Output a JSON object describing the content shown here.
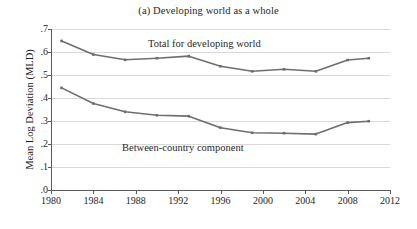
{
  "chart_data": {
    "type": "line",
    "title": "(a) Developing world as a whole",
    "xlabel": "",
    "ylabel": "Mean Log Deviation (MLD)",
    "xlim": [
      1980,
      2012
    ],
    "ylim": [
      0.0,
      0.7
    ],
    "xticks": [
      1980,
      1984,
      1988,
      1992,
      1996,
      2000,
      2004,
      2008,
      2012
    ],
    "xtick_labels": [
      "1980",
      "1984",
      "1988",
      "1992",
      "1996",
      "2000",
      "2004",
      "2008",
      "2012"
    ],
    "yticks": [
      0.0,
      0.1,
      0.2,
      0.3,
      0.4,
      0.5,
      0.6,
      0.7
    ],
    "ytick_labels": [
      ".0",
      ".1",
      ".2",
      ".3",
      ".4",
      ".5",
      ".6",
      ".7"
    ],
    "grid": true,
    "legend_position": "inline-annotation",
    "line_color": "#6e6e6e",
    "grid_color": "#d9d9d9",
    "axis_color": "#5a5a5a",
    "series": [
      {
        "name": "Total for developing world",
        "label_text": "Total for developing world",
        "x": [
          1981,
          1984,
          1987,
          1990,
          1993,
          1996,
          1999,
          2002,
          2005,
          2008,
          2010
        ],
        "values": [
          0.648,
          0.589,
          0.566,
          0.573,
          0.582,
          0.538,
          0.516,
          0.525,
          0.516,
          0.565,
          0.573
        ]
      },
      {
        "name": "Between-country component",
        "label_text": "Between-country component",
        "x": [
          1981,
          1984,
          1987,
          1990,
          1993,
          1996,
          1999,
          2002,
          2005,
          2008,
          2010
        ],
        "values": [
          0.444,
          0.376,
          0.34,
          0.325,
          0.321,
          0.271,
          0.249,
          0.247,
          0.243,
          0.293,
          0.299
        ]
      }
    ]
  }
}
